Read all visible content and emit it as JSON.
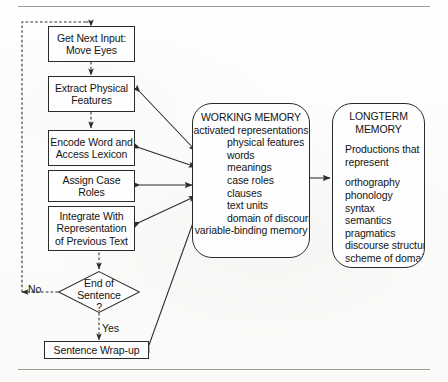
{
  "figure": {
    "type": "flow-diagram",
    "background_color": "#fdfdfc",
    "line_color": "#2b2b2b",
    "rule_color": "#9a9a97"
  },
  "process_boxes": [
    {
      "id": "get-next-input",
      "lines": [
        "Get Next Input:",
        "Move Eyes"
      ]
    },
    {
      "id": "extract-physical-features",
      "lines": [
        "Extract Physical",
        "Features"
      ]
    },
    {
      "id": "encode-word",
      "lines": [
        "Encode Word and",
        "Access Lexicon"
      ]
    },
    {
      "id": "assign-case-roles",
      "lines": [
        "Assign Case",
        "Roles"
      ]
    },
    {
      "id": "integrate-with-representation",
      "lines": [
        "Integrate With",
        "Representation",
        "of Previous Text"
      ]
    },
    {
      "id": "sentence-wrap-up",
      "lines": [
        "Sentence Wrap-up"
      ]
    }
  ],
  "decision": {
    "id": "end-of-sentence",
    "lines": [
      "End of",
      "Sentence",
      "?"
    ],
    "branch_no": "No",
    "branch_yes": "Yes"
  },
  "working_memory": {
    "title": "WORKING MEMORY",
    "subtitle": "activated representations",
    "items": [
      "physical features",
      "words",
      "meanings",
      "case roles",
      "clauses",
      "text units",
      "domain of discourse"
    ],
    "footer": "variable-binding memory"
  },
  "longterm_memory": {
    "title_line1": "LONGTERM",
    "title_line2": "MEMORY",
    "subtitle_line1": "Productions that",
    "subtitle_line2": "represent",
    "items": [
      "orthography",
      "phonology",
      "syntax",
      "semantics",
      "pragmatics",
      "discourse structure",
      "scheme of domain",
      "episodic knowledge"
    ]
  }
}
